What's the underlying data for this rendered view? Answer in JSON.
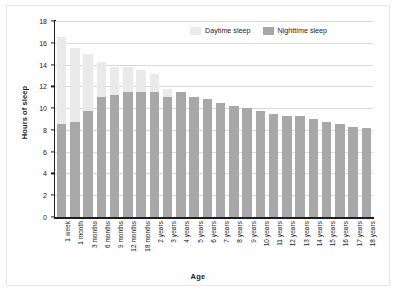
{
  "chart_data": {
    "type": "bar",
    "stacked": true,
    "title": "",
    "xlabel": "Age",
    "ylabel": "Hours of sleep",
    "ylim": [
      0,
      18
    ],
    "ytick_step": 2,
    "yticks": [
      0,
      2,
      4,
      6,
      8,
      10,
      12,
      14,
      16,
      18
    ],
    "grid": "horizontal",
    "legend_position": "top-right",
    "categories": [
      "1 week",
      "1 month",
      "3 months",
      "6 months",
      "9 months",
      "12 months",
      "18 months",
      "2 years",
      "3 years",
      "4 years",
      "5 years",
      "6 years",
      "7 years",
      "8 years",
      "9 years",
      "10 years",
      "11 years",
      "12 years",
      "13 years",
      "14 years",
      "15 years",
      "16 years",
      "17 years",
      "18 years"
    ],
    "series": [
      {
        "name": "Nighttime sleep",
        "color": "#a8a8a8",
        "values": [
          8.5,
          8.7,
          9.7,
          11.0,
          11.2,
          11.5,
          11.5,
          11.5,
          11.0,
          11.5,
          11.0,
          10.8,
          10.5,
          10.2,
          10.0,
          9.7,
          9.5,
          9.25,
          9.25,
          9.0,
          8.75,
          8.5,
          8.25,
          8.2
        ]
      },
      {
        "name": "Daytime sleep",
        "color": "#eaeaea",
        "values": [
          8.0,
          6.8,
          5.3,
          3.2,
          2.6,
          2.3,
          2.0,
          1.6,
          0.8,
          0.0,
          0.0,
          0.0,
          0.0,
          0.0,
          0.0,
          0.0,
          0.0,
          0.0,
          0.0,
          0.0,
          0.0,
          0.0,
          0.0,
          0.0
        ]
      }
    ],
    "totals": [
      16.5,
      15.5,
      15.0,
      14.2,
      13.8,
      13.8,
      13.5,
      13.1,
      11.8,
      11.5,
      11.0,
      10.8,
      10.5,
      10.2,
      10.0,
      9.7,
      9.5,
      9.25,
      9.25,
      9.0,
      8.75,
      8.5,
      8.25,
      8.2
    ]
  },
  "legend": {
    "items": [
      {
        "label": "Daytime sleep",
        "color": "#eaeaea"
      },
      {
        "label": "Nighttime sleep",
        "color": "#a8a8a8"
      }
    ]
  },
  "axes": {
    "y_title": "Hours of sleep",
    "x_title": "Age"
  }
}
